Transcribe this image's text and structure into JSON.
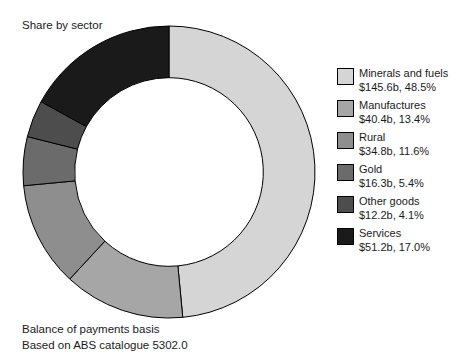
{
  "chart": {
    "title": "Share by sector",
    "footnotes": [
      "Balance of payments basis",
      "Based on ABS catalogue 5302.0"
    ]
  },
  "chart_data": {
    "type": "pie",
    "variant": "donut",
    "title": "Share by sector",
    "subtitle": "",
    "xlabel": "",
    "ylabel": "",
    "start_angle_deg": 0,
    "direction": "clockwise",
    "inner_radius_ratio": 0.646,
    "total_value": 300.5,
    "value_unit": "$b",
    "legend_position": "right",
    "grid": false,
    "annotations": [
      "Balance of payments basis",
      "Based on ABS catalogue 5302.0"
    ],
    "categories": [
      "Minerals and fuels",
      "Manufactures",
      "Rural",
      "Gold",
      "Other goods",
      "Services"
    ],
    "values": [
      145.6,
      40.4,
      34.8,
      16.3,
      12.2,
      51.2
    ],
    "percentages": [
      48.5,
      13.4,
      11.6,
      5.4,
      4.1,
      17.0
    ],
    "value_labels": [
      "$145.6b, 48.5%",
      "$40.4b, 13.4%",
      "$34.8b, 11.6%",
      "$16.3b, 5.4%",
      "$12.2b, 4.1%",
      "$51.2b, 17.0%"
    ],
    "colors": [
      "#d5d5d5",
      "#a6a6a6",
      "#8e8e8e",
      "#6b6b6b",
      "#4d4d4d",
      "#1a1a1a"
    ]
  },
  "legend": {
    "items": [
      {
        "label": "Minerals and fuels",
        "value": "$145.6b, 48.5%",
        "color": "#d5d5d5"
      },
      {
        "label": "Manufactures",
        "value": "$40.4b, 13.4%",
        "color": "#a6a6a6"
      },
      {
        "label": "Rural",
        "value": "$34.8b, 11.6%",
        "color": "#8e8e8e"
      },
      {
        "label": "Gold",
        "value": "$16.3b, 5.4%",
        "color": "#6b6b6b"
      },
      {
        "label": "Other goods",
        "value": "$12.2b, 4.1%",
        "color": "#4d4d4d"
      },
      {
        "label": "Services",
        "value": "$51.2b, 17.0%",
        "color": "#1a1a1a"
      }
    ]
  }
}
